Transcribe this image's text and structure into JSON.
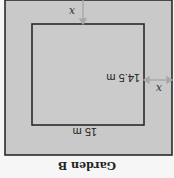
{
  "diagram": {
    "title": "Garden B",
    "inner_width_label": "15 m",
    "inner_height_label": "14.5 m",
    "path_width_label_top": "x",
    "path_width_label_side": "x",
    "colors": {
      "outer_fill": "#c9c9c9",
      "inner_fill": "#cbcbcb",
      "border": "#2a2a2a",
      "arrow": "#a8a8a8",
      "background": "#f6f6f6"
    },
    "orientation": "rotated 180 degrees"
  }
}
